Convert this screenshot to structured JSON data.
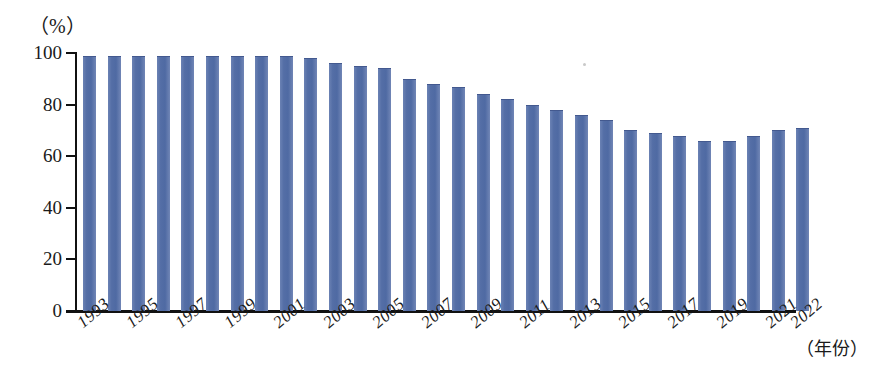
{
  "chart_data": {
    "type": "bar",
    "title": "",
    "subtitle": "",
    "xlabel": "（年份）",
    "ylabel": "（%）",
    "ylim": [
      0,
      100
    ],
    "yticks": [
      0,
      20,
      40,
      60,
      80,
      100
    ],
    "ytick_labels": [
      "0",
      "20",
      "40",
      "60",
      "80",
      "100"
    ],
    "grid": false,
    "legend": null,
    "bar_color": "#5b74a8",
    "categories": [
      "1993",
      "1994",
      "1995",
      "1996",
      "1997",
      "1998",
      "1999",
      "2000",
      "2001",
      "2002",
      "2003",
      "2004",
      "2005",
      "2006",
      "2007",
      "2008",
      "2009",
      "2010",
      "2011",
      "2012",
      "2013",
      "2014",
      "2015",
      "2016",
      "2017",
      "2018",
      "2019",
      "2020",
      "2021",
      "2022"
    ],
    "values": [
      99,
      99,
      99,
      99,
      99,
      99,
      99,
      99,
      99,
      98,
      96,
      95,
      94,
      90,
      88,
      87,
      84,
      82,
      80,
      78,
      76,
      74,
      70,
      69,
      68,
      66,
      66,
      68,
      70,
      71
    ],
    "visible_tick_labels": [
      "1993",
      "1995",
      "1997",
      "1999",
      "2001",
      "2003",
      "2005",
      "2007",
      "2009",
      "2011",
      "2013",
      "2015",
      "2017",
      "2019",
      "2021",
      "2022"
    ],
    "annotations": []
  },
  "axis": {
    "unit_label": "（%）",
    "year_label": "（年份）"
  }
}
